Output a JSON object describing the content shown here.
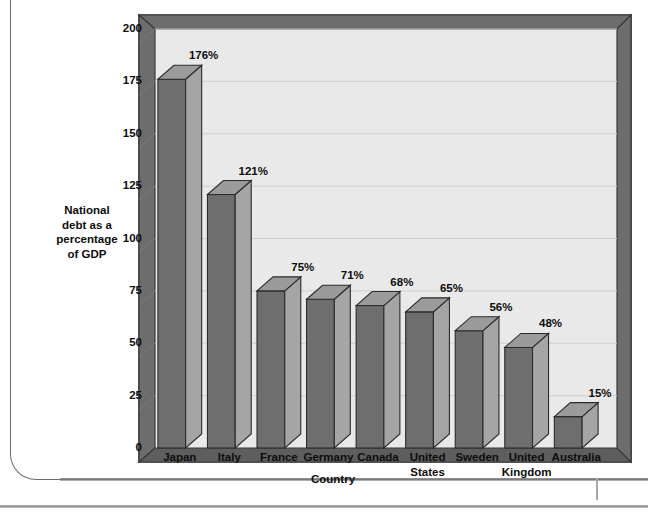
{
  "chart_data": {
    "type": "bar",
    "title": "",
    "subtitle": "",
    "xlabel": "Country",
    "ylabel": "National debt as a percentage of  GDP",
    "ylabel_lines": [
      "National",
      "debt as a",
      "percentage",
      "of  GDP"
    ],
    "categories": [
      "Japan",
      "Italy",
      "France",
      "Germany",
      "Canada",
      "United States",
      "Sweden",
      "United Kingdom",
      "Australia"
    ],
    "category_lines": [
      [
        "Japan"
      ],
      [
        "Italy"
      ],
      [
        "France"
      ],
      [
        "Germany"
      ],
      [
        "Canada"
      ],
      [
        "United",
        "States"
      ],
      [
        "Sweden"
      ],
      [
        "United",
        "Kingdom"
      ],
      [
        "Australia"
      ]
    ],
    "values": [
      176,
      121,
      75,
      71,
      68,
      65,
      56,
      48,
      15
    ],
    "data_labels": [
      "176%",
      "121%",
      "75%",
      "71%",
      "68%",
      "65%",
      "56%",
      "48%",
      "15%"
    ],
    "ylim": [
      0,
      200
    ],
    "ytick_values": [
      200,
      175,
      150,
      125,
      100,
      75,
      50,
      25,
      0
    ],
    "ytick_labels": [
      "200",
      "175",
      "150",
      "125",
      "100",
      "75",
      "50",
      "25",
      "0"
    ],
    "grid": true,
    "grid_axis": "y",
    "legend": false,
    "legend_position": "none",
    "style": "3d-column",
    "units": "percent of GDP"
  },
  "colors": {
    "bar_front": "#6e6e6e",
    "bar_side": "#a5a5a5",
    "bar_top": "#9b9b9b",
    "bar_outline": "#2b2b2b",
    "plot_background": "#e9e9e9",
    "wall_left": "#6d6d6d",
    "wall_top": "#6d6d6d",
    "floor": "#5e5e5e",
    "frame_edge": "#3a3a3a",
    "gridline": "#cfcfcf",
    "text": "#0d0d0d",
    "page_border": "#6b6b6b"
  }
}
